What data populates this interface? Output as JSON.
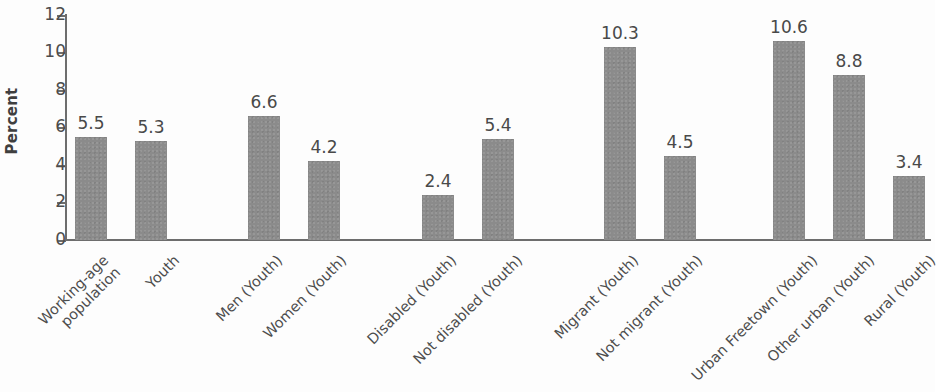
{
  "chart_data": {
    "type": "bar",
    "title": "",
    "subtitle": "",
    "xlabel": "",
    "ylabel": "Percent",
    "ylim": [
      0,
      12
    ],
    "ytick_labels": [
      "12",
      "10",
      "8",
      "6",
      "4",
      "2",
      "0"
    ],
    "yticks": [
      12,
      10,
      8,
      6,
      4,
      2,
      0
    ],
    "grid": false,
    "legend": null,
    "bar_color": "#8b8b8b",
    "axis_color": "#6d6d6d",
    "text_color": "#4d4d4d",
    "categories": [
      "Working-age\npopulation",
      "Youth",
      "Men (Youth)",
      "Women (Youth)",
      "Disabled (Youth)",
      "Not disabled (Youth)",
      "Migrant (Youth)",
      "Not migrant (Youth)",
      "Urban Freetown (Youth)",
      "Other urban (Youth)",
      "Rural (Youth)"
    ],
    "values": [
      5.5,
      5.3,
      6.6,
      4.2,
      2.4,
      5.4,
      10.3,
      4.5,
      10.6,
      8.8,
      3.4
    ],
    "value_labels": [
      "5.5",
      "5.3",
      "6.6",
      "4.2",
      "2.4",
      "5.4",
      "10.3",
      "4.5",
      "10.6",
      "8.8",
      "3.4"
    ],
    "groups": [
      {
        "name": "overall",
        "category_indices": [
          0,
          1
        ]
      },
      {
        "name": "sex",
        "category_indices": [
          2,
          3
        ]
      },
      {
        "name": "disability",
        "category_indices": [
          4,
          5
        ]
      },
      {
        "name": "migration",
        "category_indices": [
          6,
          7
        ]
      },
      {
        "name": "location",
        "category_indices": [
          8,
          9,
          10
        ]
      }
    ]
  }
}
